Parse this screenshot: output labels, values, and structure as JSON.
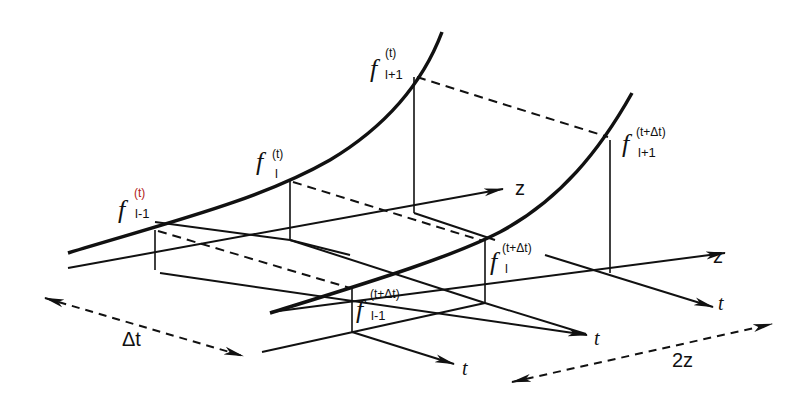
{
  "diagram": {
    "colors": {
      "ink": "#111111",
      "accent_superscript": "#b22222",
      "background": "#ffffff"
    },
    "nodes_time_t": [
      {
        "symbol": "f",
        "superscript": "(t)",
        "subscript": "l-1"
      },
      {
        "symbol": "f",
        "superscript": "(t)",
        "subscript": "l"
      },
      {
        "symbol": "f",
        "superscript": "(t)",
        "subscript": "l+1"
      }
    ],
    "nodes_time_t_dt": [
      {
        "symbol": "f",
        "superscript": "(t+Δt)",
        "subscript": "l-1"
      },
      {
        "symbol": "f",
        "superscript": "(t+Δt)",
        "subscript": "l"
      },
      {
        "symbol": "f",
        "superscript": "(t+Δt)",
        "subscript": "l+1"
      }
    ],
    "axes": {
      "z_labels": [
        "z",
        "z"
      ],
      "t_labels": [
        "t",
        "t",
        "t"
      ]
    },
    "dimensions": {
      "time_step": "Δt",
      "space_step": "2z"
    }
  }
}
